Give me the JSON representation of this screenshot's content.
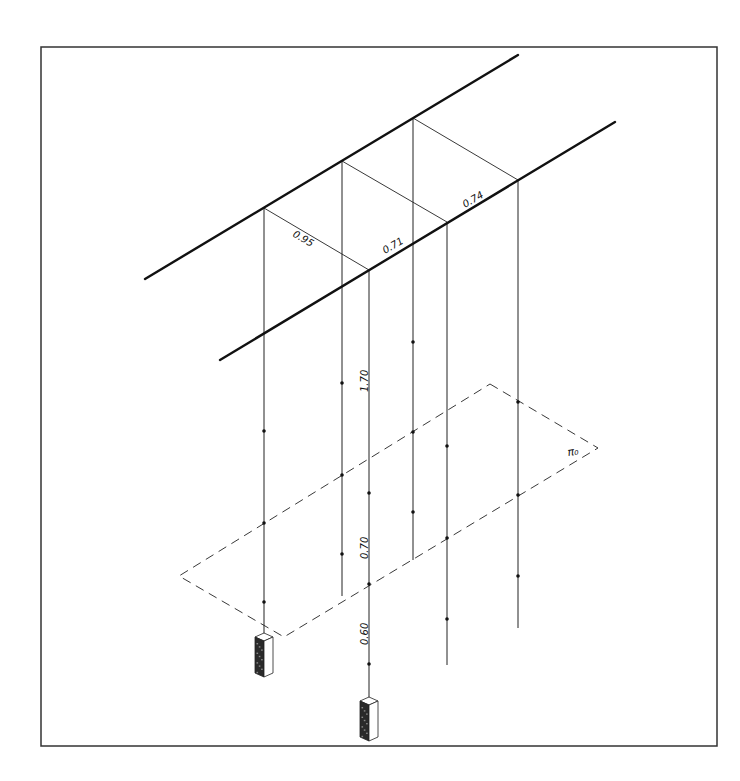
{
  "diagram": {
    "type": "isometric-plumbing-schematic",
    "border": {
      "x": 41,
      "y": 47,
      "width": 676,
      "height": 699
    },
    "colors": {
      "ink": "#1a1a1a",
      "paper": "#ffffff",
      "box_dark": "#2a2a2a"
    },
    "labels": {
      "horizontal_spacing_1": "0.95",
      "horizontal_spacing_2": "0.71",
      "horizontal_spacing_3": "0.74",
      "vertical_height_1": "1.70",
      "vertical_height_2": "0.70",
      "vertical_height_3": "0.60",
      "plane_label": "π₀"
    },
    "rails": [
      {
        "name": "rear-rail",
        "x1": 145,
        "y1": 279,
        "x2": 518,
        "y2": 55
      },
      {
        "name": "front-rail",
        "x1": 220,
        "y1": 360,
        "x2": 615,
        "y2": 122
      }
    ],
    "cross_links": [
      {
        "x1": 264,
        "y1": 208,
        "x2": 369,
        "y2": 270
      },
      {
        "x1": 342,
        "y1": 161,
        "x2": 447,
        "y2": 222
      },
      {
        "x1": 413,
        "y1": 118,
        "x2": 518,
        "y2": 180
      }
    ],
    "verticals": [
      {
        "x": 264,
        "y_top": 208,
        "y_bottom": 636,
        "dots": [
          431,
          523,
          602
        ]
      },
      {
        "x": 342,
        "y_top": 161,
        "y_bottom": 596,
        "dots": [
          383,
          475,
          554
        ]
      },
      {
        "x": 369,
        "y_top": 270,
        "y_bottom": 700,
        "dots": [
          493,
          584,
          664
        ]
      },
      {
        "x": 413,
        "y_top": 118,
        "y_bottom": 560,
        "dots": [
          342,
          432,
          512
        ]
      },
      {
        "x": 447,
        "y_top": 222,
        "y_bottom": 665,
        "dots": [
          446,
          538,
          619
        ]
      },
      {
        "x": 518,
        "y_top": 180,
        "y_bottom": 628,
        "dots": [
          402,
          495,
          576
        ]
      }
    ],
    "plane": {
      "points": [
        [
          490,
          384
        ],
        [
          598,
          448
        ],
        [
          284,
          637
        ],
        [
          179,
          576
        ]
      ]
    },
    "boxes": [
      {
        "name": "device-box-1",
        "cx": 264,
        "top": 633
      },
      {
        "name": "device-box-2",
        "cx": 369,
        "top": 697
      }
    ]
  }
}
